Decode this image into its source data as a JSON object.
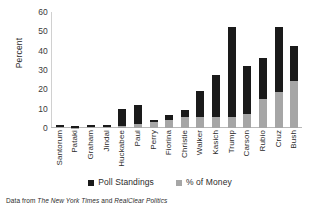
{
  "chart_data": {
    "type": "bar",
    "stacked": true,
    "title": "",
    "xlabel": "",
    "ylabel": "Percent",
    "ylim": [
      0,
      60
    ],
    "yticks": [
      60,
      50,
      40,
      30,
      20,
      10,
      0
    ],
    "grid": false,
    "legend_position": "bottom",
    "categories": [
      "Santorum",
      "Pataki",
      "Graham",
      "Jindal",
      "Huckabee",
      "Paul",
      "Perry",
      "Fiorina",
      "Christie",
      "Walker",
      "Kasich",
      "Trump",
      "Carson",
      "Rubio",
      "Cruz",
      "Bush"
    ],
    "series": [
      {
        "name": "% of Money",
        "color": "#a6a6a6",
        "values": [
          0.3,
          0.2,
          0.4,
          0.3,
          0.8,
          2.2,
          3.2,
          4.2,
          5.6,
          5.6,
          5.8,
          5.8,
          7.5,
          15.0,
          18.8,
          24.3
        ]
      },
      {
        "name": "Poll Standings",
        "color": "#1a1a1a",
        "values": [
          1.2,
          0.6,
          1.3,
          1.2,
          9.0,
          9.8,
          0.8,
          2.4,
          3.7,
          13.4,
          21.8,
          46.2,
          24.8,
          21.0,
          33.2,
          17.9
        ]
      }
    ],
    "totals": [
      1.5,
      0.8,
      1.7,
      1.5,
      9.8,
      12.0,
      4.0,
      6.6,
      9.3,
      19.0,
      27.6,
      52.0,
      32.3,
      36.0,
      52.0,
      42.2
    ]
  },
  "legend": {
    "items": [
      {
        "label": "Poll Standings",
        "color": "#1a1a1a"
      },
      {
        "label": "% of Money",
        "color": "#a6a6a6"
      }
    ]
  },
  "caption": {
    "prefix": "Data from ",
    "source_1": "The New York Times",
    "conjunction": " and ",
    "source_2": "RealClear Politics"
  }
}
